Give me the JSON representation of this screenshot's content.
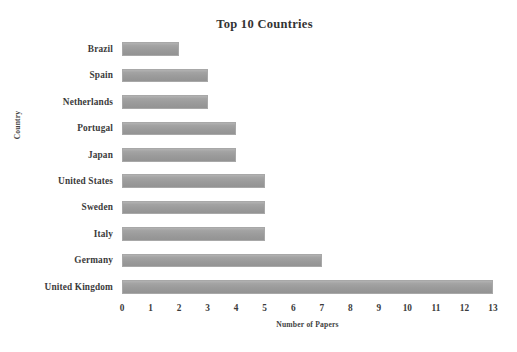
{
  "chart_data": {
    "type": "bar",
    "orientation": "horizontal",
    "title": "Top 10 Countries",
    "xlabel": "Number of Papers",
    "ylabel": "Country",
    "categories": [
      "Brazil",
      "Spain",
      "Netherlands",
      "Portugal",
      "Japan",
      "United States",
      "Sweden",
      "Italy",
      "Germany",
      "United Kingdom"
    ],
    "values": [
      2,
      3,
      3,
      4,
      4,
      5,
      5,
      5,
      7,
      13
    ],
    "xlim": [
      0,
      13
    ],
    "xticks": [
      "0",
      "1",
      "2",
      "3",
      "4",
      "5",
      "6",
      "7",
      "8",
      "9",
      "10",
      "11",
      "12",
      "13"
    ],
    "xtick_values": [
      0,
      1,
      2,
      3,
      4,
      5,
      6,
      7,
      8,
      9,
      10,
      11,
      12,
      13
    ],
    "grid": false,
    "legend": null,
    "bar_color": "#9c9c9c",
    "background_color": "#ffffff",
    "text_color": "#3b3b3b"
  }
}
